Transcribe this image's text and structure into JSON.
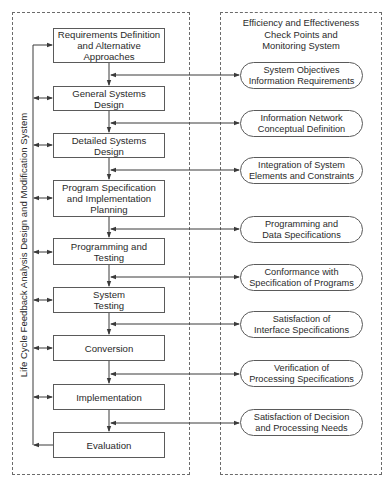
{
  "diagram": {
    "left_panel": {
      "label": "Life Cycle Feedback Analysis Design and Modification System",
      "steps": [
        {
          "label": "Requirements Definition\nand Alternative\nApproaches"
        },
        {
          "label": "General Systems\nDesign"
        },
        {
          "label": "Detailed Systems\nDesign"
        },
        {
          "label": "Program Specification\nand Implementation\nPlanning"
        },
        {
          "label": "Programming and\nTesting"
        },
        {
          "label": "System\nTesting"
        },
        {
          "label": "Conversion"
        },
        {
          "label": "Implementation"
        },
        {
          "label": "Evaluation"
        }
      ]
    },
    "right_panel": {
      "title": "Efficiency and Effectiveness\nCheck Points and\nMonitoring System",
      "checkpoints": [
        {
          "label": "System Objectives\nInformation Requirements"
        },
        {
          "label": "Information Network\nConceptual Definition"
        },
        {
          "label": "Integration of System\nElements and Constraints"
        },
        {
          "label": "Programming and\nData Specifications"
        },
        {
          "label": "Conformance with\nSpecification of Programs"
        },
        {
          "label": "Satisfaction of\nInterface Specifications"
        },
        {
          "label": "Verification of\nProcessing Specifications"
        },
        {
          "label": "Satisfaction of Decision\nand Processing Needs"
        }
      ]
    },
    "colors": {
      "line": "#3a3a3a",
      "dash": "#6b6b6b"
    }
  }
}
